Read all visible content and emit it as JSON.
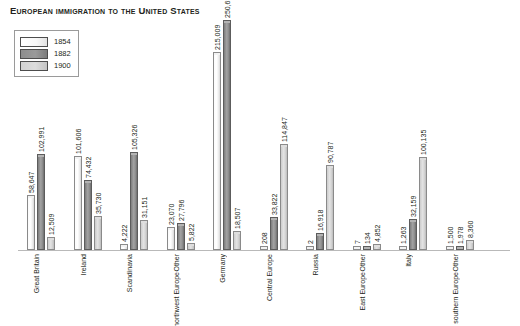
{
  "title": "European immigration to the United States",
  "legend": {
    "position": "top-left",
    "entries": [
      {
        "label": "1854",
        "swatch": "white",
        "color": "#ffffff"
      },
      {
        "label": "1882",
        "swatch": "dark-gray",
        "color": "#8d8d8d"
      },
      {
        "label": "1900",
        "swatch": "light-gray",
        "color": "#d2d2d2"
      }
    ]
  },
  "chart_data": {
    "type": "bar",
    "title": "European immigration to the United States",
    "xlabel": "",
    "ylabel": "",
    "grid": false,
    "legend_position": "top-left",
    "ylim": [
      0,
      250630
    ],
    "categories": [
      "Great Britain",
      "Ireland",
      "Scandinavia",
      "Other northwest Europe",
      "Germany",
      "Central Europe",
      "Russia",
      "Other East Europe",
      "Italy",
      "Other southern Europe"
    ],
    "series": [
      {
        "name": "1854",
        "values": [
          58647,
          101606,
          4222,
          23070,
          215009,
          208,
          2,
          7,
          1263,
          1500
        ],
        "labels": [
          "58,647",
          "101,606",
          "4,222",
          "23,070",
          "215,009",
          "208",
          "2",
          "7",
          "1,263",
          "1,500"
        ]
      },
      {
        "name": "1882",
        "values": [
          102991,
          74432,
          105326,
          27796,
          250630,
          33822,
          16918,
          134,
          32159,
          1978
        ],
        "labels": [
          "102,991",
          "74,432",
          "105,326",
          "27,796",
          "250,630",
          "33,822",
          "16,918",
          "134",
          "32,159",
          "1,978"
        ]
      },
      {
        "name": "1900",
        "values": [
          12509,
          35730,
          31151,
          5822,
          18507,
          114847,
          90787,
          4852,
          100135,
          8360
        ],
        "labels": [
          "12,509",
          "35,730",
          "31,151",
          "5,822",
          "18,507",
          "114,847",
          "90,787",
          "4,852",
          "100,135",
          "8,360"
        ]
      }
    ]
  }
}
